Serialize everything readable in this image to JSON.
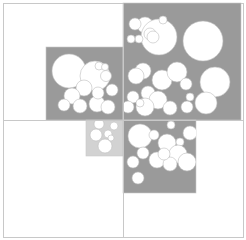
{
  "diagram": {
    "type": "quadtree-circle-packing",
    "width": 246,
    "height": 240,
    "colors": {
      "background": "#ffffff",
      "frame_stroke": "#c8c8c8",
      "cell_dark": "#9a9a9a",
      "cell_light": "#d2d2d2",
      "circle_fill": "#ffffff",
      "circle_stroke": "#bdbdbd"
    },
    "frame": {
      "x": 3,
      "y": 3,
      "w": 240,
      "h": 234
    },
    "dividers": [
      {
        "x1": 123,
        "y1": 3,
        "x2": 123,
        "y2": 237
      },
      {
        "x1": 3,
        "y1": 120,
        "x2": 243,
        "y2": 120
      }
    ],
    "cells": [
      {
        "name": "cell-top-left",
        "x": 46,
        "y": 47,
        "w": 77,
        "h": 73,
        "shade": "dark",
        "circles": [
          [
            69,
            71,
            17
          ],
          [
            95,
            76,
            15
          ],
          [
            99,
            66,
            4
          ],
          [
            105,
            67,
            3.5
          ],
          [
            106,
            76,
            5.5
          ],
          [
            84,
            88,
            8
          ],
          [
            112,
            90,
            6
          ],
          [
            72,
            96,
            8
          ],
          [
            64,
            105,
            6
          ],
          [
            80,
            106,
            7
          ],
          [
            97,
            104,
            8
          ],
          [
            108,
            107,
            7
          ],
          [
            98,
            93,
            6
          ]
        ]
      },
      {
        "name": "cell-top-right",
        "x": 123,
        "y": 3,
        "w": 118,
        "h": 117,
        "shade": "dark",
        "circles": [
          [
            145,
            25,
            8
          ],
          [
            135,
            24,
            6
          ],
          [
            159,
            37,
            18
          ],
          [
            150,
            34,
            6
          ],
          [
            153,
            37,
            6
          ],
          [
            163,
            20,
            4
          ],
          [
            139,
            39,
            4
          ],
          [
            131,
            39,
            4
          ],
          [
            203,
            41,
            20
          ],
          [
            143,
            71,
            8
          ],
          [
            136,
            76,
            8
          ],
          [
            162,
            80,
            10
          ],
          [
            177,
            72,
            10
          ],
          [
            186,
            84,
            6
          ],
          [
            215,
            82,
            15
          ],
          [
            133,
            97,
            6
          ],
          [
            148,
            93,
            7
          ],
          [
            158,
            100,
            9
          ],
          [
            145,
            107,
            9
          ],
          [
            128,
            107,
            6
          ],
          [
            140,
            103,
            4
          ],
          [
            190,
            97,
            4
          ],
          [
            206,
            103,
            11
          ],
          [
            187,
            107,
            6
          ],
          [
            170,
            108,
            7
          ]
        ]
      },
      {
        "name": "cell-bottom-center",
        "x": 86,
        "y": 120,
        "w": 37,
        "h": 36,
        "shade": "light",
        "circles": [
          [
            99,
            124,
            5
          ],
          [
            114,
            126,
            4
          ],
          [
            96,
            135,
            6
          ],
          [
            108,
            134,
            4
          ],
          [
            111,
            138,
            3
          ],
          [
            105,
            146,
            7
          ]
        ]
      },
      {
        "name": "cell-bottom-right",
        "x": 123,
        "y": 120,
        "w": 73,
        "h": 73,
        "shade": "dark",
        "circles": [
          [
            140,
            136,
            12
          ],
          [
            171,
            125,
            4
          ],
          [
            154,
            135,
            5
          ],
          [
            167,
            143,
            9
          ],
          [
            180,
            142,
            4
          ],
          [
            190,
            133,
            7
          ],
          [
            178,
            154,
            9
          ],
          [
            143,
            153,
            6
          ],
          [
            157,
            160,
            8
          ],
          [
            170,
            164,
            7
          ],
          [
            187,
            162,
            9
          ],
          [
            133,
            162,
            6
          ],
          [
            138,
            178,
            6
          ],
          [
            164,
            154,
            6
          ]
        ]
      }
    ]
  }
}
